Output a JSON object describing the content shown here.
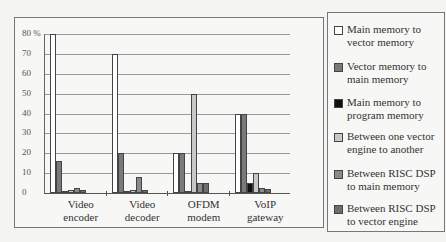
{
  "chart_data": {
    "type": "bar",
    "title": "",
    "xlabel": "",
    "ylabel": "%",
    "ylim": [
      0,
      80
    ],
    "yticks": [
      "0",
      "10",
      "20",
      "30",
      "40",
      "50",
      "60",
      "70",
      "80 %"
    ],
    "grid": true,
    "legend_position": "right",
    "categories": [
      "Video encoder",
      "Video decoder",
      "OFDM modem",
      "VoIP gateway"
    ],
    "series": [
      {
        "name": "Main memory to vector memory",
        "color": "#ffffff",
        "values": [
          80,
          70,
          20,
          40
        ]
      },
      {
        "name": "Vector memory to main memory",
        "color": "#7a7a7a",
        "values": [
          16,
          20,
          20,
          40
        ]
      },
      {
        "name": "Main memory to program memory",
        "color": "#111111",
        "values": [
          1,
          1,
          1,
          5
        ]
      },
      {
        "name": "Between one vector engine to another",
        "color": "#c8c8c8",
        "values": [
          1.5,
          1.5,
          50,
          10
        ]
      },
      {
        "name": "Between RISC DSP to main memory",
        "color": "#8a8a8a",
        "values": [
          2.5,
          8,
          5,
          2.5
        ]
      },
      {
        "name": "Between RISC DSP to vector engine",
        "color": "#6e6e6e",
        "values": [
          1.5,
          1.5,
          5,
          2
        ]
      }
    ]
  },
  "axis": {
    "y_labels": [
      "80 %",
      "70",
      "60",
      "50",
      "40",
      "30",
      "20",
      "10",
      "0"
    ]
  },
  "x_labels": [
    {
      "line1": "Video",
      "line2": "encoder"
    },
    {
      "line1": "Video",
      "line2": "decoder"
    },
    {
      "line1": "OFDM",
      "line2": "modem"
    },
    {
      "line1": "VoIP",
      "line2": "gateway"
    }
  ],
  "legend": [
    {
      "line1": "Main memory to",
      "line2": "vector memory",
      "color": "#ffffff"
    },
    {
      "line1": "Vector memory to",
      "line2": "main memory",
      "color": "#7a7a7a"
    },
    {
      "line1": "Main memory to",
      "line2": "program memory",
      "color": "#111111"
    },
    {
      "line1": "Between one vector",
      "line2": "engine to another",
      "color": "#c8c8c8"
    },
    {
      "line1": "Between RISC DSP",
      "line2": "to main memory",
      "color": "#8a8a8a"
    },
    {
      "line1": "Between RISC DSP",
      "line2": "to vector engine",
      "color": "#6e6e6e"
    }
  ]
}
